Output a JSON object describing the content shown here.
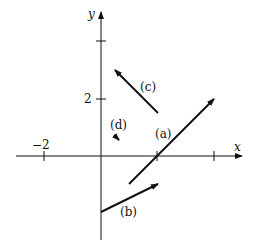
{
  "diagram": {
    "axes": {
      "x_label": "x",
      "y_label": "y",
      "x_ticks": [
        {
          "value": -2,
          "label": "−2"
        },
        {
          "value": 2,
          "label": ""
        },
        {
          "value": 4,
          "label": ""
        }
      ],
      "y_ticks": [
        {
          "value": 2,
          "label": "2"
        },
        {
          "value": 4,
          "label": ""
        }
      ]
    },
    "vectors": [
      {
        "id": "a",
        "label": "(a)",
        "from": [
          1,
          -1
        ],
        "to": [
          4,
          2
        ]
      },
      {
        "id": "b",
        "label": "(b)",
        "from": [
          0,
          -2
        ],
        "to": [
          2,
          -1
        ]
      },
      {
        "id": "c",
        "label": "(c)",
        "from": [
          2,
          1.5
        ],
        "to": [
          0.5,
          3
        ]
      },
      {
        "id": "d",
        "label": "(d)",
        "from": [
          0.5,
          0.7
        ],
        "to": [
          0.65,
          0.55
        ]
      }
    ],
    "tick_labels": {
      "x_neg2": "−2",
      "y_2": "2"
    },
    "vector_labels": {
      "a": "(a)",
      "b": "(b)",
      "c": "(c)",
      "d": "(d)"
    }
  }
}
